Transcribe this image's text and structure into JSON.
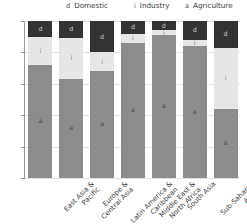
{
  "chart_data": {
    "type": "bar",
    "subtype": "stacked-100-percent",
    "title": "",
    "xlabel": "",
    "ylabel": "",
    "ylim": [
      0,
      100
    ],
    "yticks": [
      0,
      20,
      40,
      60,
      80,
      100
    ],
    "grid": true,
    "legend_position": "top",
    "categories": [
      "East Asia &\nPacific",
      "Europe &\nCentral Asia",
      "Latin America &\nCaribbean",
      "Middle East &\nNorth Africa",
      "South Asia",
      "Sub-Saharan\nAfrica",
      "High-income"
    ],
    "series": [
      {
        "name": "Agriculture",
        "key": "a",
        "color": "#8c8c8c",
        "values": [
          72,
          63,
          68,
          86,
          91,
          84,
          44
        ]
      },
      {
        "name": "Industry",
        "key": "i",
        "color": "#e6e6e6",
        "values": [
          18,
          26,
          12,
          6,
          3,
          4,
          39
        ]
      },
      {
        "name": "Domestic",
        "key": "d",
        "color": "#333333",
        "values": [
          10,
          11,
          20,
          8,
          6,
          12,
          17
        ]
      }
    ]
  },
  "legend": {
    "items": [
      {
        "key": "d",
        "label": "Domestic"
      },
      {
        "key": "i",
        "label": "Industry"
      },
      {
        "key": "a",
        "label": "Agriculture"
      }
    ]
  },
  "axis": {
    "y_tick_labels": [
      "0",
      "20",
      "40",
      "60",
      "80",
      "100"
    ]
  },
  "x_labels": [
    {
      "line1": "East Asia &",
      "line2": "Pacific"
    },
    {
      "line1": "Europe &",
      "line2": "Central Asia"
    },
    {
      "line1": "Latin America &",
      "line2": "Caribbean"
    },
    {
      "line1": "Middle East &",
      "line2": "North Africa"
    },
    {
      "line1": "South Asia",
      "line2": ""
    },
    {
      "line1": "Sub-Saharan",
      "line2": "Africa"
    },
    {
      "line1": "High-income",
      "line2": ""
    }
  ]
}
